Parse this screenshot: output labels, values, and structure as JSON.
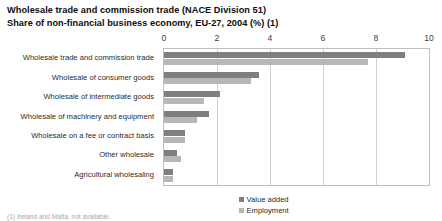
{
  "title": {
    "line1": "Wholesale trade and commission trade (NACE Division 51)",
    "line2": "Share of non-financial business economy, EU-27, 2004 (%) (1)"
  },
  "footnote": "(1) Ireland and Malta, not available.",
  "chart_data": {
    "type": "bar",
    "orientation": "horizontal",
    "xlabel": "",
    "ylabel": "",
    "xlim": [
      0,
      10
    ],
    "xticks": [
      0,
      2,
      4,
      6,
      8,
      10
    ],
    "xtick_labels": [
      "0",
      "2",
      "4",
      "6",
      "8",
      "10"
    ],
    "grid": true,
    "grid_axis": "x",
    "legend_position": "bottom-center",
    "categories": [
      "Wholesale trade and commission trade",
      "Wholesale of consumer goods",
      "Wholesale of intermediate goods",
      "Wholesale of machinery and equipment",
      "Wholesale on a fee or contract basis",
      "Other wholesale",
      "Agricultural wholesaling"
    ],
    "series": [
      {
        "name": "Value added",
        "color": "#7f7f7f",
        "values": [
          9.1,
          3.6,
          2.1,
          1.7,
          0.8,
          0.5,
          0.35
        ]
      },
      {
        "name": "Employment",
        "color": "#b7b7b7",
        "values": [
          7.7,
          3.3,
          1.5,
          1.25,
          0.8,
          0.65,
          0.35
        ]
      }
    ]
  }
}
